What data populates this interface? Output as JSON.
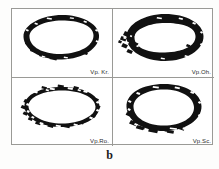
{
  "figure": {
    "caption": "b",
    "background_color": "#fdfdfc",
    "frame_color": "#9a9a96",
    "ink_color": "#111111",
    "grid": {
      "rows": 2,
      "columns": 2
    }
  },
  "panels": [
    {
      "id": "panel-top-left",
      "label": "Vp. Kr.",
      "position": "top-left",
      "stroke_style": "thick-solid",
      "shape": "ellipse",
      "notes": "thick even dark ellipse, slightly ragged lower-left"
    },
    {
      "id": "panel-top-right",
      "label": "Vp.Oh.",
      "position": "top-right",
      "stroke_style": "thick-blotted",
      "shape": "ellipse",
      "notes": "very heavy stroke with ink splatter on the left side"
    },
    {
      "id": "panel-bottom-left",
      "label": "Vp.Ro.",
      "position": "bottom-left",
      "stroke_style": "thin-scratchy",
      "shape": "ellipse",
      "notes": "thin broken scratchy outline, wide and flat"
    },
    {
      "id": "panel-bottom-right",
      "label": "Vp.Sc.",
      "position": "bottom-right",
      "stroke_style": "thick-smooth",
      "shape": "ellipse",
      "notes": "smooth heavy rounded-rectangular ellipse"
    }
  ]
}
